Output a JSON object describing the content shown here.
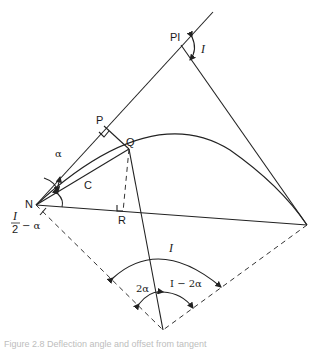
{
  "diagram": {
    "labels": {
      "pi": "PI",
      "i_at_pi": "I",
      "p": "P",
      "q": "Q",
      "n": "N",
      "c": "C",
      "r": "R",
      "alpha": "α",
      "i_over_2_num": "I",
      "i_over_2_den": "2",
      "minus_alpha": "− α",
      "i_center": "I",
      "two_alpha": "2α",
      "i_minus_two_alpha": "I − 2α"
    },
    "caption": "Figure 2.8 Deflection angle and offset from tangent"
  }
}
